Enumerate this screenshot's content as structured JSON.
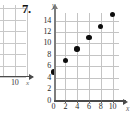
{
  "problem": {
    "number_label": "7."
  },
  "partial_chart": {
    "x_last_tick_label": "10",
    "x_axis_label": "x",
    "point": {
      "x": 10,
      "y": 15
    },
    "grid": true
  },
  "chart_data": {
    "type": "scatter",
    "title": "",
    "subtitle": "",
    "xlabel": "x",
    "ylabel": "y",
    "x": [
      0,
      2,
      4,
      6,
      8,
      10
    ],
    "values": [
      5,
      7,
      9,
      11,
      13,
      15
    ],
    "series": [
      {
        "name": "",
        "points": [
          {
            "x": 0,
            "y": 5
          },
          {
            "x": 2,
            "y": 7
          },
          {
            "x": 4,
            "y": 9
          },
          {
            "x": 6,
            "y": 11
          },
          {
            "x": 8,
            "y": 13
          },
          {
            "x": 10,
            "y": 15
          }
        ]
      }
    ],
    "xlim": [
      0,
      11
    ],
    "ylim": [
      0,
      15.4
    ],
    "x_tick_labels": [
      "0",
      "2",
      "4",
      "6",
      "8",
      "10"
    ],
    "x_ticks": [
      0,
      2,
      4,
      6,
      8,
      10
    ],
    "y_tick_labels": [
      "0",
      "2",
      "4",
      "6",
      "8",
      "10",
      "12",
      "14"
    ],
    "y_ticks": [
      0,
      2,
      4,
      6,
      8,
      10,
      12,
      14
    ],
    "grid": true,
    "legend": "none",
    "annotations": []
  },
  "colors": {
    "point": "#0d0d0d",
    "grid": "#c4c4c4",
    "axis": "#4a4a4a",
    "background": "#ffffff"
  }
}
